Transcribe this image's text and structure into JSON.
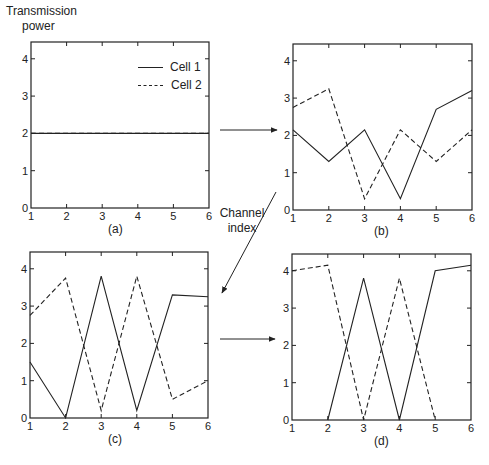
{
  "figure": {
    "ylabel_line1": "Transmission",
    "ylabel_line2": "power",
    "xlabel_line1": "Channel",
    "xlabel_line2": "index",
    "legend": [
      {
        "name": "Cell 1",
        "style": "solid"
      },
      {
        "name": "Cell 2",
        "style": "dashed"
      }
    ],
    "line_color": "#222222"
  },
  "chart_data": [
    {
      "type": "line",
      "panel": "(a)",
      "x": [
        1,
        2,
        3,
        4,
        5,
        6
      ],
      "xlim": [
        1,
        6
      ],
      "ylim": [
        0,
        4.45
      ],
      "xticks": [
        1,
        2,
        3,
        4,
        5,
        6
      ],
      "yticks": [
        0,
        1,
        2,
        3,
        4
      ],
      "xlabel": "Channel index",
      "ylabel": "Transmission power",
      "legend_position": "upper right",
      "series": [
        {
          "name": "Cell 1",
          "style": "solid",
          "values": [
            2,
            2,
            2,
            2,
            2,
            2
          ]
        },
        {
          "name": "Cell 2",
          "style": "dashed",
          "values": [
            2,
            2,
            2,
            2,
            2,
            2
          ]
        }
      ]
    },
    {
      "type": "line",
      "panel": "(b)",
      "x": [
        1,
        2,
        3,
        4,
        5,
        6
      ],
      "xlim": [
        1,
        6
      ],
      "ylim": [
        0,
        4.45
      ],
      "xticks": [
        1,
        2,
        3,
        4,
        5,
        6
      ],
      "yticks": [
        0,
        1,
        2,
        3,
        4
      ],
      "series": [
        {
          "name": "Cell 1",
          "style": "solid",
          "values": [
            2.15,
            1.3,
            2.15,
            0.3,
            2.7,
            3.2
          ]
        },
        {
          "name": "Cell 2",
          "style": "dashed",
          "values": [
            2.75,
            3.25,
            0.3,
            2.15,
            1.3,
            2.15
          ]
        }
      ]
    },
    {
      "type": "line",
      "panel": "(c)",
      "x": [
        1,
        2,
        3,
        4,
        5,
        6
      ],
      "xlim": [
        1,
        6
      ],
      "ylim": [
        0,
        4.45
      ],
      "xticks": [
        1,
        2,
        3,
        4,
        5,
        6
      ],
      "yticks": [
        0,
        1,
        2,
        3,
        4
      ],
      "series": [
        {
          "name": "Cell 1",
          "style": "solid",
          "values": [
            1.5,
            0.0,
            3.8,
            0.2,
            3.3,
            3.25
          ]
        },
        {
          "name": "Cell 2",
          "style": "dashed",
          "values": [
            2.75,
            3.75,
            0.2,
            3.8,
            0.5,
            1.0
          ]
        }
      ]
    },
    {
      "type": "line",
      "panel": "(d)",
      "x": [
        1,
        2,
        3,
        4,
        5,
        6
      ],
      "xlim": [
        1,
        6
      ],
      "ylim": [
        0,
        4.45
      ],
      "xticks": [
        1,
        2,
        3,
        4,
        5,
        6
      ],
      "yticks": [
        0,
        1,
        2,
        3,
        4
      ],
      "series": [
        {
          "name": "Cell 1",
          "style": "solid",
          "values": [
            null,
            0.0,
            3.8,
            0.0,
            4.0,
            4.15
          ]
        },
        {
          "name": "Cell 2",
          "style": "dashed",
          "values": [
            4.0,
            4.15,
            0.0,
            3.8,
            0.0,
            null
          ]
        }
      ]
    }
  ],
  "panels": [
    {
      "caption": "(a)"
    },
    {
      "caption": "(b)"
    },
    {
      "caption": "(c)"
    },
    {
      "caption": "(d)"
    }
  ]
}
